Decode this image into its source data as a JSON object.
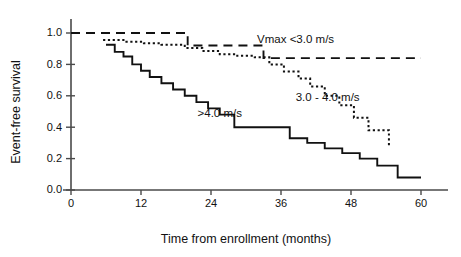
{
  "chart_data": {
    "type": "line",
    "title": "",
    "subtitle": "",
    "xlabel": "Time from enrollment (months)",
    "ylabel": "Event-free survival",
    "xlim": [
      0,
      62
    ],
    "ylim": [
      0.0,
      1.05
    ],
    "xticks": [
      0,
      12,
      24,
      36,
      48,
      60
    ],
    "xtick_labels": [
      "0",
      "12",
      "24",
      "36",
      "48",
      "60"
    ],
    "yticks": [
      0.0,
      0.2,
      0.4,
      0.6,
      0.8,
      1.0
    ],
    "ytick_labels": [
      "0.0",
      "0.2",
      "0.4",
      "0.6",
      "0.8",
      "1.0"
    ],
    "grid": false,
    "legend_position": "inline-annotations",
    "step_style": "post",
    "series": [
      {
        "name": "Vmax <3.0 m/s",
        "style": "dashed",
        "label_x": 38.5,
        "label_y": 0.935,
        "x": [
          0,
          18,
          20,
          32,
          33,
          60
        ],
        "y": [
          1.0,
          1.0,
          0.92,
          0.92,
          0.84,
          0.84
        ]
      },
      {
        "name": "3.0 - 4.0 m/s",
        "style": "dotted",
        "label_x": 44.0,
        "label_y": 0.565,
        "x": [
          5.5,
          7.5,
          9.5,
          12.5,
          15.5,
          19.5,
          22.5,
          25.5,
          28.5,
          31.5,
          34.0,
          36.5,
          39.0,
          41.0,
          43.5,
          46.0,
          48.5,
          51.0,
          54.5
        ],
        "y": [
          0.955,
          0.955,
          0.945,
          0.935,
          0.925,
          0.905,
          0.885,
          0.865,
          0.855,
          0.845,
          0.8,
          0.755,
          0.71,
          0.66,
          0.6,
          0.54,
          0.46,
          0.38,
          0.275
        ]
      },
      {
        "name": ">4.0 m/s",
        "style": "solid",
        "label_x": 25.5,
        "label_y": 0.465,
        "x": [
          6.0,
          7.5,
          9.0,
          10.5,
          12.0,
          13.5,
          15.5,
          17.5,
          19.5,
          21.5,
          23.5,
          25.5,
          28.0,
          31.5,
          34.5,
          37.5,
          40.5,
          43.5,
          46.5,
          49.5,
          52.5,
          56.0,
          60.0
        ],
        "y": [
          0.925,
          0.88,
          0.85,
          0.8,
          0.76,
          0.72,
          0.68,
          0.64,
          0.6,
          0.56,
          0.52,
          0.48,
          0.4,
          0.4,
          0.4,
          0.33,
          0.3,
          0.265,
          0.235,
          0.2,
          0.155,
          0.08,
          0.08
        ]
      }
    ]
  }
}
